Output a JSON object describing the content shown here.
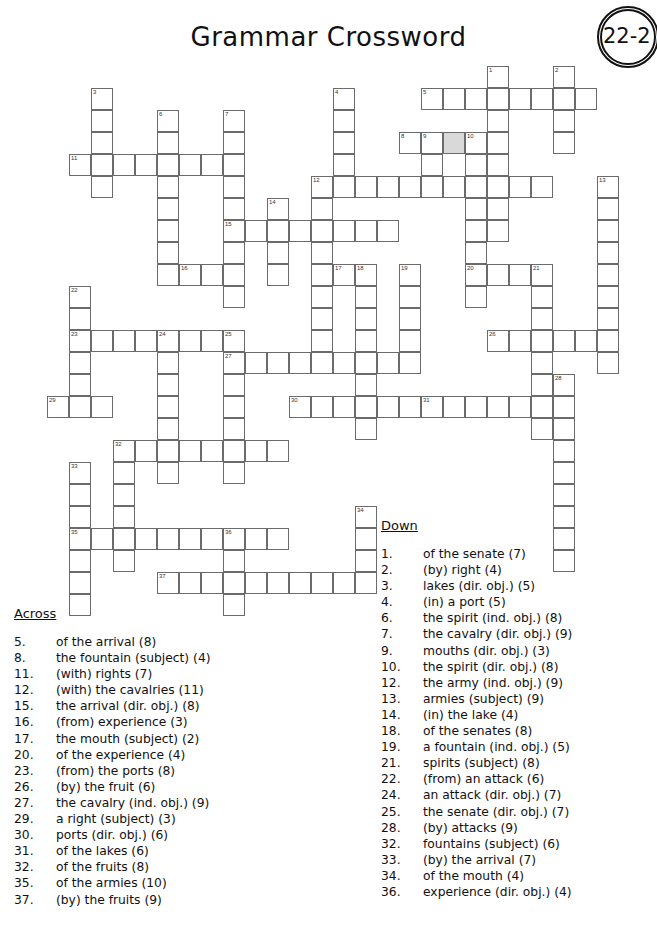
{
  "page": {
    "title": "Grammar Crossword",
    "badge_label": "22-2"
  },
  "grid": {
    "cell_size": 22,
    "origin_x": 47,
    "origin_y": 66,
    "shaded_cells": [
      [
        3,
        18
      ]
    ],
    "entries": [
      {
        "number": "1",
        "dir": "down",
        "row": 0,
        "col": 20,
        "len": 8
      },
      {
        "number": "2",
        "dir": "down",
        "row": 0,
        "col": 23,
        "len": 4
      },
      {
        "number": "3",
        "dir": "down",
        "row": 1,
        "col": 2,
        "len": 5
      },
      {
        "number": "4",
        "dir": "down",
        "row": 1,
        "col": 13,
        "len": 5
      },
      {
        "number": "5",
        "dir": "across",
        "row": 1,
        "col": 17,
        "len": 8
      },
      {
        "number": "6",
        "dir": "down",
        "row": 2,
        "col": 5,
        "len": 8
      },
      {
        "number": "7",
        "dir": "down",
        "row": 2,
        "col": 8,
        "len": 9
      },
      {
        "number": "8",
        "dir": "across",
        "row": 3,
        "col": 16,
        "len": 4
      },
      {
        "number": "9",
        "dir": "down",
        "row": 3,
        "col": 17,
        "len": 3
      },
      {
        "number": "10",
        "dir": "down",
        "row": 3,
        "col": 19,
        "len": 8
      },
      {
        "number": "11",
        "dir": "across",
        "row": 4,
        "col": 1,
        "len": 7
      },
      {
        "number": "12",
        "dir": "across",
        "row": 5,
        "col": 12,
        "len": 11
      },
      {
        "number": "12",
        "dir": "down",
        "row": 5,
        "col": 12,
        "len": 9
      },
      {
        "number": "13",
        "dir": "down",
        "row": 5,
        "col": 25,
        "len": 9
      },
      {
        "number": "14",
        "dir": "down",
        "row": 6,
        "col": 10,
        "len": 4
      },
      {
        "number": "15",
        "dir": "across",
        "row": 7,
        "col": 8,
        "len": 8
      },
      {
        "number": "16",
        "dir": "across",
        "row": 9,
        "col": 6,
        "len": 3
      },
      {
        "number": "17",
        "dir": "across",
        "row": 9,
        "col": 13,
        "len": 2
      },
      {
        "number": "18",
        "dir": "down",
        "row": 9,
        "col": 14,
        "len": 8
      },
      {
        "number": "19",
        "dir": "down",
        "row": 9,
        "col": 16,
        "len": 5
      },
      {
        "number": "20",
        "dir": "across",
        "row": 9,
        "col": 19,
        "len": 4
      },
      {
        "number": "21",
        "dir": "down",
        "row": 9,
        "col": 22,
        "len": 8
      },
      {
        "number": "22",
        "dir": "down",
        "row": 10,
        "col": 1,
        "len": 6
      },
      {
        "number": "23",
        "dir": "across",
        "row": 12,
        "col": 1,
        "len": 8
      },
      {
        "number": "24",
        "dir": "down",
        "row": 12,
        "col": 5,
        "len": 7
      },
      {
        "number": "25",
        "dir": "down",
        "row": 12,
        "col": 8,
        "len": 7
      },
      {
        "number": "26",
        "dir": "across",
        "row": 12,
        "col": 20,
        "len": 6
      },
      {
        "number": "27",
        "dir": "across",
        "row": 13,
        "col": 8,
        "len": 9
      },
      {
        "number": "28",
        "dir": "down",
        "row": 14,
        "col": 23,
        "len": 9
      },
      {
        "number": "29",
        "dir": "across",
        "row": 15,
        "col": 0,
        "len": 3
      },
      {
        "number": "30",
        "dir": "across",
        "row": 15,
        "col": 11,
        "len": 6
      },
      {
        "number": "31",
        "dir": "across",
        "row": 15,
        "col": 17,
        "len": 6
      },
      {
        "number": "32",
        "dir": "across",
        "row": 17,
        "col": 3,
        "len": 8
      },
      {
        "number": "32",
        "dir": "down",
        "row": 17,
        "col": 3,
        "len": 6
      },
      {
        "number": "33",
        "dir": "down",
        "row": 18,
        "col": 1,
        "len": 7
      },
      {
        "number": "34",
        "dir": "down",
        "row": 20,
        "col": 14,
        "len": 4
      },
      {
        "number": "35",
        "dir": "across",
        "row": 21,
        "col": 1,
        "len": 10
      },
      {
        "number": "36",
        "dir": "down",
        "row": 21,
        "col": 8,
        "len": 4
      },
      {
        "number": "37",
        "dir": "across",
        "row": 23,
        "col": 5,
        "len": 9
      }
    ]
  },
  "across": {
    "heading": "Across",
    "clues": [
      {
        "number": "5.",
        "text": "of the arrival  (8)"
      },
      {
        "number": "8.",
        "text": "the fountain (subject)  (4)"
      },
      {
        "number": "11.",
        "text": "(with) rights  (7)"
      },
      {
        "number": "12.",
        "text": "(with) the cavalries  (11)"
      },
      {
        "number": "15.",
        "text": "the arrival (dir. obj.)  (8)"
      },
      {
        "number": "16.",
        "text": "(from) experience  (3)"
      },
      {
        "number": "17.",
        "text": "the mouth (subject)  (2)"
      },
      {
        "number": "20.",
        "text": "of the experience  (4)"
      },
      {
        "number": "23.",
        "text": "(from) the ports  (8)"
      },
      {
        "number": "26.",
        "text": "(by) the fruit  (6)"
      },
      {
        "number": "27.",
        "text": "the cavalry (ind. obj.)  (9)"
      },
      {
        "number": "29.",
        "text": "a right (subject)  (3)"
      },
      {
        "number": "30.",
        "text": "ports (dir. obj.)  (6)"
      },
      {
        "number": "31.",
        "text": "of the lakes  (6)"
      },
      {
        "number": "32.",
        "text": "of the fruits  (8)"
      },
      {
        "number": "35.",
        "text": "of the armies  (10)"
      },
      {
        "number": "37.",
        "text": "(by) the fruits  (9)"
      }
    ]
  },
  "down": {
    "heading": "Down",
    "clues": [
      {
        "number": "1.",
        "text": "of the senate  (7)"
      },
      {
        "number": "2.",
        "text": "(by) right  (4)"
      },
      {
        "number": "3.",
        "text": "lakes (dir. obj.)  (5)"
      },
      {
        "number": "4.",
        "text": "(in) a port  (5)"
      },
      {
        "number": "6.",
        "text": "the spirit (ind. obj.)  (8)"
      },
      {
        "number": "7.",
        "text": "the cavalry (dir. obj.)  (9)"
      },
      {
        "number": "9.",
        "text": "mouths (dir. obj.)  (3)"
      },
      {
        "number": "10.",
        "text": "the spirit (dir. obj.)  (8)"
      },
      {
        "number": "12.",
        "text": "the army (ind. obj.)  (9)"
      },
      {
        "number": "13.",
        "text": "armies (subject)  (9)"
      },
      {
        "number": "14.",
        "text": "(in) the lake  (4)"
      },
      {
        "number": "18.",
        "text": "of the senates  (8)"
      },
      {
        "number": "19.",
        "text": "a fountain (ind. obj.)  (5)"
      },
      {
        "number": "21.",
        "text": "spirits (subject)  (8)"
      },
      {
        "number": "22.",
        "text": "(from) an attack  (6)"
      },
      {
        "number": "24.",
        "text": "an attack (dir. obj.)  (7)"
      },
      {
        "number": "25.",
        "text": "the senate (dir. obj.)  (7)"
      },
      {
        "number": "28.",
        "text": "(by) attacks  (9)"
      },
      {
        "number": "32.",
        "text": "fountains (subject)  (6)"
      },
      {
        "number": "33.",
        "text": "(by) the arrival  (7)"
      },
      {
        "number": "34.",
        "text": "of the mouth  (4)"
      },
      {
        "number": "36.",
        "text": "experience (dir. obj.)  (4)"
      }
    ]
  }
}
